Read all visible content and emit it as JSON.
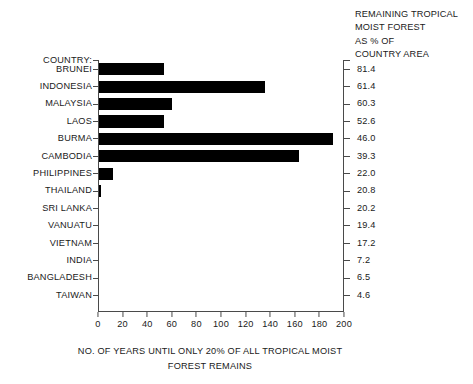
{
  "legend_header": {
    "lines": [
      "REMAINING TROPICAL",
      "MOIST FOREST",
      "AS % OF",
      "COUNTRY AREA"
    ]
  },
  "axis": {
    "header_row_label": "COUNTRY:",
    "ticks": [
      0,
      20,
      40,
      60,
      80,
      100,
      120,
      140,
      160,
      180,
      200
    ],
    "tick_labels": [
      "0",
      "20",
      "40",
      "60",
      "80",
      "100",
      "120",
      "140",
      "160",
      "180",
      "200"
    ]
  },
  "caption": {
    "line1": "NO. OF YEARS UNTIL ONLY 20% OF ALL TROPICAL MOIST",
    "line2": "FOREST REMAINS"
  },
  "colors": {
    "bar": "#000000",
    "axis": "#4a4a4a",
    "text": "#1a1a1a",
    "background": "#ffffff"
  },
  "chart_data": {
    "type": "bar",
    "orientation": "horizontal",
    "title": "",
    "xlabel": "NO. OF YEARS UNTIL ONLY 20% OF ALL TROPICAL MOIST FOREST REMAINS",
    "ylabel": "COUNTRY:",
    "xlim": [
      0,
      200
    ],
    "grid": false,
    "legend": "none",
    "secondary_axis_label": "REMAINING TROPICAL MOIST FOREST AS % OF COUNTRY AREA",
    "categories": [
      "BRUNEI",
      "INDONESIA",
      "MALAYSIA",
      "LAOS",
      "BURMA",
      "CAMBODIA",
      "PHILIPPINES",
      "THAILAND",
      "SRI LANKA",
      "VANUATU",
      "VIETNAM",
      "INDIA",
      "BANGLADESH",
      "TAIWAN"
    ],
    "values": [
      53,
      135,
      59,
      53,
      190,
      163,
      11,
      2,
      0,
      0,
      0,
      0,
      0,
      0
    ],
    "value_labels": [
      "53",
      "135",
      "59",
      "53",
      "190",
      "163",
      "11",
      "2",
      "0",
      "0",
      "0",
      "0",
      "0",
      "0"
    ],
    "secondary_values": [
      81.4,
      61.4,
      60.3,
      52.6,
      46.0,
      39.3,
      22.0,
      20.8,
      20.2,
      19.4,
      17.2,
      7.2,
      6.5,
      4.6
    ],
    "secondary_value_labels": [
      "81.4",
      "61.4",
      "60.3",
      "52.6",
      "46.0",
      "39.3",
      "22.0",
      "20.8",
      "20.2",
      "19.4",
      "17.2",
      "7.2",
      "6.5",
      "4.6"
    ]
  }
}
